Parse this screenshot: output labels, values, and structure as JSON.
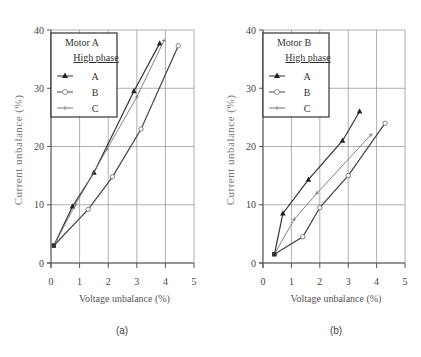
{
  "chart_data": [
    {
      "type": "line",
      "panel": "(a)",
      "title": "",
      "xlabel": "Voltage unbalance (%)",
      "ylabel": "Current unbalance (%)",
      "xlim": [
        0,
        5
      ],
      "ylim": [
        0,
        40
      ],
      "xticks": [
        "0",
        "1",
        "2",
        "3",
        "4",
        "5"
      ],
      "yticks": [
        "0",
        "10",
        "20",
        "30",
        "40"
      ],
      "grid": true,
      "legend": {
        "title": "Motor A",
        "subtitle": "High phase",
        "position": "upper left",
        "entries": [
          "A",
          "B",
          "C"
        ]
      },
      "series": [
        {
          "name": "A",
          "marker": "filled-triangle",
          "x": [
            0.1,
            0.75,
            1.5,
            2.9,
            3.8
          ],
          "y": [
            3.0,
            9.7,
            15.5,
            29.5,
            37.7
          ]
        },
        {
          "name": "B",
          "marker": "open-circle",
          "x": [
            0.1,
            1.3,
            2.15,
            3.15,
            4.45
          ],
          "y": [
            3.0,
            9.2,
            14.8,
            23.0,
            37.3
          ]
        },
        {
          "name": "C",
          "marker": "plus",
          "x": [
            0.1,
            0.85,
            1.95,
            3.0,
            3.95
          ],
          "y": [
            3.0,
            10.0,
            19.5,
            28.5,
            38.2
          ]
        }
      ]
    },
    {
      "type": "line",
      "panel": "(b)",
      "title": "",
      "xlabel": "Voltage unbalance (%)",
      "ylabel": "Current unbalance (%)",
      "xlim": [
        0,
        5
      ],
      "ylim": [
        0,
        40
      ],
      "xticks": [
        "0",
        "1",
        "2",
        "3",
        "4",
        "5"
      ],
      "yticks": [
        "0",
        "10",
        "20",
        "30",
        "40"
      ],
      "grid": true,
      "legend": {
        "title": "Motor B",
        "subtitle": "High phase",
        "position": "upper left",
        "entries": [
          "A",
          "B",
          "C"
        ]
      },
      "series": [
        {
          "name": "A",
          "marker": "filled-triangle",
          "x": [
            0.4,
            0.7,
            1.6,
            2.8,
            3.4
          ],
          "y": [
            1.5,
            8.5,
            14.3,
            21.0,
            26.0
          ]
        },
        {
          "name": "B",
          "marker": "open-circle",
          "x": [
            0.4,
            1.4,
            2.0,
            3.0,
            4.3
          ],
          "y": [
            1.5,
            4.5,
            9.5,
            15.0,
            24.0
          ]
        },
        {
          "name": "C",
          "marker": "plus",
          "x": [
            0.4,
            1.1,
            1.9,
            3.8
          ],
          "y": [
            1.5,
            7.5,
            12.0,
            22.0
          ]
        }
      ]
    }
  ],
  "figure": {
    "captions": [
      "(a)",
      "(b)"
    ]
  }
}
